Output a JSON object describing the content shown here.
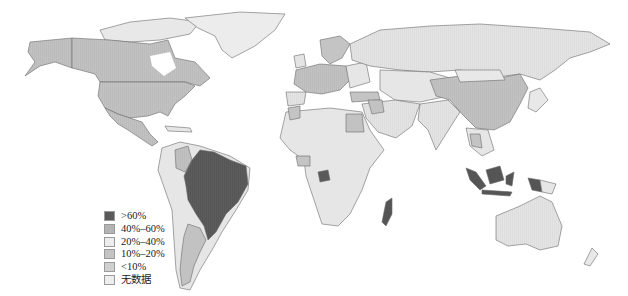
{
  "map": {
    "type": "choropleth world map",
    "background": "#ffffff",
    "border_color": "#6a6a6a",
    "classes": {
      "gt60": "#5a5a5a",
      "40_60": "#b4b4b4",
      "20_40": "#e6e6e6",
      "10_20": "#c6c6c6",
      "lt10": "#d2d2d2",
      "nodata": "#ececec"
    },
    "regions": [
      {
        "name": "Brazil",
        "class": ">60%"
      },
      {
        "name": "Gabon",
        "class": ">60%"
      },
      {
        "name": "Madagascar",
        "class": ">60%"
      },
      {
        "name": "Indonesia",
        "class": ">60%"
      },
      {
        "name": "Colombia",
        "class": "40%–60%"
      },
      {
        "name": "Argentina",
        "class": "10%–20%"
      },
      {
        "name": "United States",
        "class": "10%–20%"
      },
      {
        "name": "Canada",
        "class": "10%–20%"
      },
      {
        "name": "Mexico",
        "class": "10%–20%"
      },
      {
        "name": "China",
        "class": "10%–20%"
      },
      {
        "name": "Europe (central)",
        "class": "10%–20%"
      },
      {
        "name": "Egypt",
        "class": "10%–20%"
      },
      {
        "name": "Turkey",
        "class": "10%–20%"
      },
      {
        "name": "Russia",
        "class": "20%–40%"
      },
      {
        "name": "Australia",
        "class": "<10%"
      },
      {
        "name": "Greenland",
        "class": "无数据"
      }
    ]
  },
  "legend": {
    "items": [
      {
        "label": ">60%",
        "color": "#5a5a5a"
      },
      {
        "label": "40%–60%",
        "color": "#b4b4b4"
      },
      {
        "label": "20%–40%",
        "color": "#ededed"
      },
      {
        "label": "10%–20%",
        "color": "#c4c4c4"
      },
      {
        "label": "<10%",
        "color": "#d0d0d0"
      },
      {
        "label": "无数据",
        "color": "#eeeeee"
      }
    ]
  }
}
